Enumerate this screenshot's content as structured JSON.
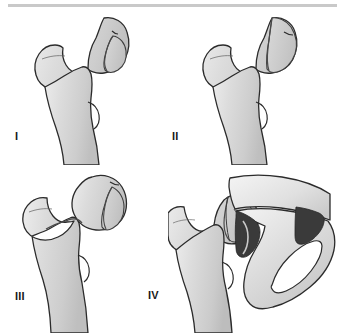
{
  "figure": {
    "background_color": "#ffffff",
    "divider": {
      "name": "top-horizontal-rule",
      "color": "#c9c9c9"
    },
    "palette": {
      "bone_fill_light": "#e6e6e6",
      "bone_fill_mid": "#d2d2d2",
      "bone_fill_shadow": "#bdbdbd",
      "bone_outline": "#2b2b2b",
      "fracture_line": "#4a4a4a",
      "fragment_fill": "#c7c7c7",
      "acetabulum_dark": "#3a3a3a",
      "label_color": "#1a1a1a"
    }
  },
  "panels": [
    {
      "label": "I",
      "name": "panel-pipkin-type-1",
      "description": "Proximal femur with small infrafoveal femoral head fracture fragment on the medial head",
      "structures": [
        "femoral head",
        "femoral neck",
        "greater trochanter",
        "lesser trochanter",
        "femoral shaft",
        "head fracture fragment"
      ]
    },
    {
      "label": "II",
      "name": "panel-pipkin-type-2",
      "description": "Proximal femur with large suprafoveal femoral head fracture fragment extending above the fovea",
      "structures": [
        "femoral head",
        "femoral neck",
        "greater trochanter",
        "lesser trochanter",
        "femoral shaft",
        "head fracture fragment"
      ]
    },
    {
      "label": "III",
      "name": "panel-pipkin-type-3",
      "description": "Femoral head fracture with associated transverse femoral neck fracture",
      "structures": [
        "femoral head",
        "femoral neck fracture",
        "greater trochanter",
        "lesser trochanter",
        "femoral shaft",
        "head fracture fragment"
      ]
    },
    {
      "label": "IV",
      "name": "panel-pipkin-type-4",
      "description": "Femoral head fracture with associated acetabular fracture; pelvis with obturator foramen shown",
      "structures": [
        "femoral head",
        "femoral neck",
        "femoral shaft",
        "acetabulum",
        "iliac wing",
        "obturator foramen",
        "acetabular fracture fragment"
      ]
    }
  ]
}
